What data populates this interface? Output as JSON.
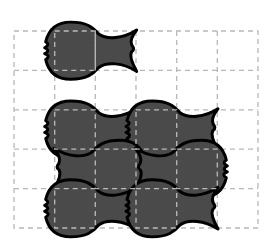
{
  "diagram": {
    "type": "tessellation-grid",
    "grid": {
      "columns": 6,
      "rows": 5,
      "line_style": "dashed",
      "line_color": "#b8b8b8"
    },
    "tile_shape": "fish",
    "colors": {
      "fill": "#4a4a4a",
      "outline": "#000000",
      "background": "#ffffff"
    },
    "tiles": [
      {
        "id": "fish-1",
        "facing": "left",
        "body_col": 1,
        "row": 0
      },
      {
        "id": "fish-2",
        "facing": "left",
        "body_col": 1,
        "row": 2
      },
      {
        "id": "fish-3",
        "facing": "left",
        "body_col": 3,
        "row": 2
      },
      {
        "id": "fish-4",
        "facing": "right",
        "body_col": 2,
        "row": 3
      },
      {
        "id": "fish-5",
        "facing": "right",
        "body_col": 4,
        "row": 3
      },
      {
        "id": "fish-6",
        "facing": "left",
        "body_col": 1,
        "row": 4
      },
      {
        "id": "fish-7",
        "facing": "left",
        "body_col": 3,
        "row": 4
      }
    ]
  }
}
